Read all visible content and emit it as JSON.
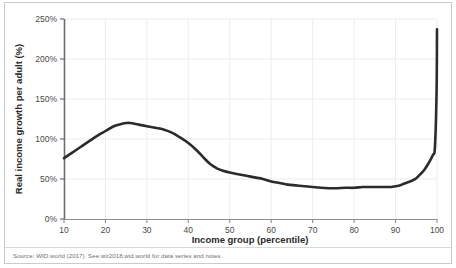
{
  "figure": {
    "source_note": "Source: WID.world (2017). See wir2018.wid.world for data series and notes."
  },
  "chart_data": {
    "type": "line",
    "title": "",
    "xlabel": "Income group (percentile)",
    "ylabel": "Real income growth per adult (%)",
    "xlim": [
      10,
      100
    ],
    "ylim": [
      0,
      250
    ],
    "grid": true,
    "legend": null,
    "x_tick_labels": [
      "10",
      "20",
      "30",
      "40",
      "50",
      "60",
      "70",
      "80",
      "90",
      "100"
    ],
    "x_ticks": [
      10,
      20,
      30,
      40,
      50,
      60,
      70,
      80,
      90,
      100
    ],
    "y_tick_labels": [
      "0%",
      "50%",
      "100%",
      "150%",
      "200%",
      "250%"
    ],
    "y_ticks": [
      0,
      50,
      100,
      150,
      200,
      250
    ],
    "line_color": "#2b2b2b",
    "line_width": 2.6,
    "series": [
      {
        "name": "Real income growth per adult",
        "x": [
          10,
          12,
          14,
          16,
          18,
          20,
          22,
          24,
          25,
          26,
          28,
          30,
          32,
          34,
          36,
          38,
          40,
          42,
          44,
          45,
          46,
          47,
          48,
          50,
          52,
          54,
          56,
          58,
          60,
          62,
          64,
          66,
          68,
          70,
          72,
          74,
          75,
          76,
          78,
          80,
          82,
          84,
          86,
          88,
          89,
          90,
          91,
          92,
          93,
          94,
          95,
          96,
          97,
          98,
          99,
          99.5,
          99.9,
          100
        ],
        "values": [
          76,
          83,
          90,
          97,
          104,
          110,
          116,
          119,
          120,
          120,
          118,
          116,
          114,
          112,
          108,
          102,
          95,
          86,
          75,
          70,
          66,
          63,
          61,
          58,
          56,
          54,
          52,
          50,
          47,
          45,
          43,
          42,
          41,
          40,
          39,
          38.5,
          38.5,
          38.5,
          39,
          39,
          40,
          40,
          40,
          40,
          40,
          41,
          42,
          44,
          46,
          48,
          51,
          56,
          62,
          70,
          80,
          90,
          160,
          237
        ]
      }
    ]
  }
}
